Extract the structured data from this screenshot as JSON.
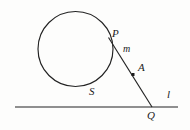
{
  "figure": {
    "stroke_color": "#222222",
    "background_color": "#fdfdfc"
  },
  "labels": {
    "point_p": "P",
    "line_m": "m",
    "point_a": "A",
    "circle_s": "S",
    "point_q": "Q",
    "line_l": "l"
  },
  "geometry": {
    "circle": {
      "name": "S",
      "cx": 75.5,
      "cy": 49,
      "r": 37.5
    },
    "tangent_segment": {
      "name": "m",
      "x1": 108.5,
      "y1": 37.5,
      "x2": 152,
      "y2": 107
    },
    "baseline": {
      "name": "l",
      "x1": 15,
      "y1": 107,
      "x2": 178,
      "y2": 107
    },
    "marked_point": {
      "name": "A",
      "cx": 133,
      "cy": 74.5,
      "size": 3
    },
    "tangency_point": {
      "name": "P",
      "cx": 108.5,
      "cy": 37.5
    },
    "intersection_point": {
      "name": "Q",
      "cx": 152,
      "cy": 107
    }
  }
}
